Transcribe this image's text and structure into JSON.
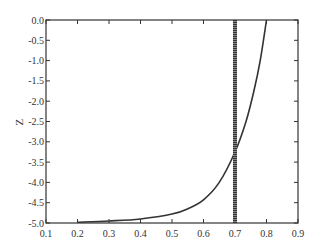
{
  "chart_data": {
    "type": "line",
    "title": "",
    "xlabel": "",
    "ylabel": "Z",
    "xlim": [
      0.1,
      0.9
    ],
    "ylim": [
      -5.0,
      0.0
    ],
    "grid": false,
    "legend": null,
    "x_ticks": [
      "0.1",
      "0.2",
      "0.3",
      "0.4",
      "0.5",
      "0.6",
      "0.7",
      "0.8",
      "0.9"
    ],
    "y_ticks": [
      "0.0",
      "-0.5",
      "-1.0",
      "-1.5",
      "-2.0",
      "-2.5",
      "-3.0",
      "-3.5",
      "-4.0",
      "-4.5",
      "-5.0"
    ],
    "series": [
      {
        "name": "curve",
        "color": "#333333",
        "x": [
          0.2,
          0.3,
          0.4,
          0.5,
          0.55,
          0.6,
          0.65,
          0.7,
          0.735,
          0.76,
          0.78,
          0.8
        ],
        "y": [
          -4.98,
          -4.95,
          -4.9,
          -4.78,
          -4.65,
          -4.43,
          -4.0,
          -3.25,
          -2.5,
          -1.75,
          -1.0,
          0.0
        ]
      },
      {
        "name": "vertical-line",
        "color": "#555555",
        "style": "dotted-thick",
        "x": [
          0.7,
          0.7
        ],
        "y": [
          -5.0,
          0.0
        ]
      }
    ]
  }
}
